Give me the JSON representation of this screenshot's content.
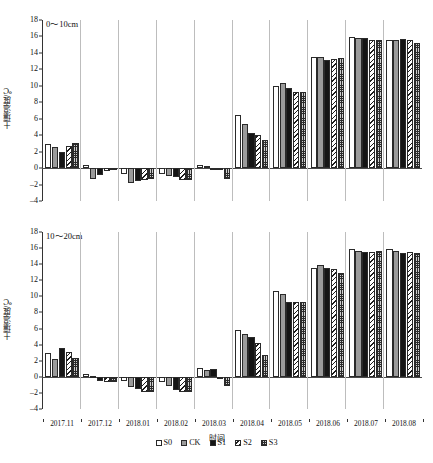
{
  "figure": {
    "xlabel": "时间",
    "ylabel": "土壤温度/℃",
    "legend_title": ""
  },
  "legend": [
    {
      "key": "S0",
      "label": "S0",
      "pattern": "white"
    },
    {
      "key": "CK",
      "label": "CK",
      "pattern": "gray"
    },
    {
      "key": "S1",
      "label": "S1",
      "pattern": "black"
    },
    {
      "key": "S2",
      "label": "S2",
      "pattern": "diagonal-hatch"
    },
    {
      "key": "S3",
      "label": "S3",
      "pattern": "dotted-grid"
    }
  ],
  "yticks": [
    "18",
    "16",
    "14",
    "12",
    "10",
    "8",
    "6",
    "4",
    "2",
    "0",
    "-2",
    "-4"
  ],
  "categories": [
    "2017.11",
    "2017.12",
    "2018.01",
    "2018.02",
    "2018.03",
    "2018.04",
    "2018.05",
    "2018.06",
    "2018.07",
    "2018.08"
  ],
  "chart_data": [
    {
      "type": "bar",
      "title": "0～10cm",
      "panel": "top",
      "xlabel": "时间",
      "ylabel": "土壤温度/℃",
      "ylim": [
        -4,
        18
      ],
      "ytick_step": 2,
      "grid": false,
      "legend_position": "bottom-center",
      "categories": [
        "2017.11",
        "2017.12",
        "2018.01",
        "2018.02",
        "2018.03",
        "2018.04",
        "2018.05",
        "2018.06",
        "2018.07",
        "2018.08"
      ],
      "series": [
        {
          "name": "S0",
          "values": [
            2.9,
            0.4,
            -0.7,
            -0.7,
            0.4,
            6.4,
            10.0,
            13.5,
            15.9,
            15.6
          ]
        },
        {
          "name": "CK",
          "values": [
            2.6,
            -1.3,
            -1.8,
            -1.0,
            0.2,
            5.4,
            10.3,
            13.5,
            15.8,
            15.6
          ]
        },
        {
          "name": "S1",
          "values": [
            1.9,
            -0.9,
            -1.6,
            -1.1,
            -0.1,
            4.3,
            9.7,
            13.1,
            15.8,
            15.7
          ]
        },
        {
          "name": "S2",
          "values": [
            2.7,
            -0.4,
            -1.4,
            -1.5,
            0.0,
            4.0,
            9.3,
            13.2,
            15.6,
            15.6
          ]
        },
        {
          "name": "S3",
          "values": [
            3.0,
            0.0,
            -1.3,
            -1.5,
            -1.3,
            3.4,
            9.3,
            13.4,
            15.6,
            15.2
          ]
        }
      ]
    },
    {
      "type": "bar",
      "title": "10～20cm",
      "panel": "bottom",
      "xlabel": "时间",
      "ylabel": "土壤温度/℃",
      "ylim": [
        -4,
        18
      ],
      "ytick_step": 2,
      "grid": false,
      "legend_position": "bottom-center",
      "categories": [
        "2017.11",
        "2017.12",
        "2018.01",
        "2018.02",
        "2018.03",
        "2018.04",
        "2018.05",
        "2018.06",
        "2018.07",
        "2018.08"
      ],
      "series": [
        {
          "name": "S0",
          "values": [
            3.0,
            0.3,
            -0.5,
            -0.7,
            1.1,
            5.8,
            10.7,
            13.5,
            15.9,
            15.9
          ]
        },
        {
          "name": "CK",
          "values": [
            2.2,
            0.1,
            -1.3,
            -1.2,
            0.8,
            5.3,
            10.3,
            13.9,
            15.7,
            15.7
          ]
        },
        {
          "name": "S1",
          "values": [
            3.6,
            -0.5,
            -1.5,
            -1.6,
            1.0,
            4.9,
            9.3,
            13.5,
            15.5,
            15.4
          ]
        },
        {
          "name": "S2",
          "values": [
            3.1,
            -0.7,
            -1.9,
            -1.9,
            0.0,
            4.2,
            9.3,
            13.4,
            15.5,
            15.5
          ]
        },
        {
          "name": "S3",
          "values": [
            2.3,
            -0.6,
            -1.9,
            -1.9,
            -1.1,
            2.7,
            9.3,
            12.9,
            15.6,
            15.4
          ]
        }
      ]
    }
  ]
}
